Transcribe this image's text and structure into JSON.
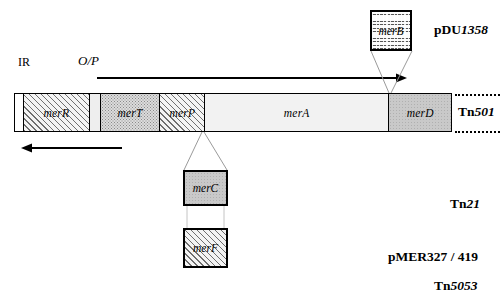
{
  "diagram": {
    "labels": {
      "ir": "IR",
      "operator_promoter": "O/P"
    },
    "bar_genes": [
      {
        "id": "ir",
        "label": "",
        "fill": "white",
        "width_px": 9
      },
      {
        "id": "merR",
        "label": "merR",
        "fill": "hatch",
        "width_px": 66
      },
      {
        "id": "spacer",
        "label": "",
        "fill": "spacer",
        "width_px": 11
      },
      {
        "id": "merT",
        "label": "merT",
        "fill": "stipple-med",
        "width_px": 60
      },
      {
        "id": "merP",
        "label": "merP",
        "fill": "hatch",
        "width_px": 45
      },
      {
        "id": "merA",
        "label": "merA",
        "fill": "stipple-light",
        "width_px": 185
      },
      {
        "id": "merD",
        "label": "merD",
        "fill": "grey",
        "width_px": 62
      }
    ],
    "callouts": [
      {
        "id": "merB",
        "label": "merB",
        "fill": "wavy",
        "position": "top-right"
      },
      {
        "id": "merC",
        "label": "merC",
        "fill": "grey",
        "position": "bottom-middle"
      },
      {
        "id": "merF",
        "label": "merF",
        "fill": "hatch",
        "position": "bottom-middle-lower"
      }
    ],
    "side_labels": [
      {
        "id": "pDU1358",
        "prefix": "pDU",
        "number": "1358",
        "text": "pDU1358"
      },
      {
        "id": "Tn501",
        "prefix": "Tn",
        "number": "501",
        "text": "Tn501"
      },
      {
        "id": "Tn21",
        "prefix": "Tn",
        "number": "21",
        "text": "Tn21"
      },
      {
        "id": "pMER327",
        "prefix": "",
        "number": "",
        "text": "pMER327 / 419"
      },
      {
        "id": "Tn5053",
        "prefix": "Tn",
        "number": "5053",
        "text": "Tn5053"
      }
    ],
    "arrows": [
      {
        "id": "forward-transcript",
        "direction": "right",
        "description": "structural gene transcription merTPAD"
      },
      {
        "id": "reverse-transcript",
        "direction": "left",
        "description": "merR regulatory gene transcription"
      }
    ],
    "colors": {
      "line": "#000000",
      "grey_fill": "#c9c9c9",
      "light_fill": "#f2f2f2",
      "background": "#ffffff"
    }
  }
}
